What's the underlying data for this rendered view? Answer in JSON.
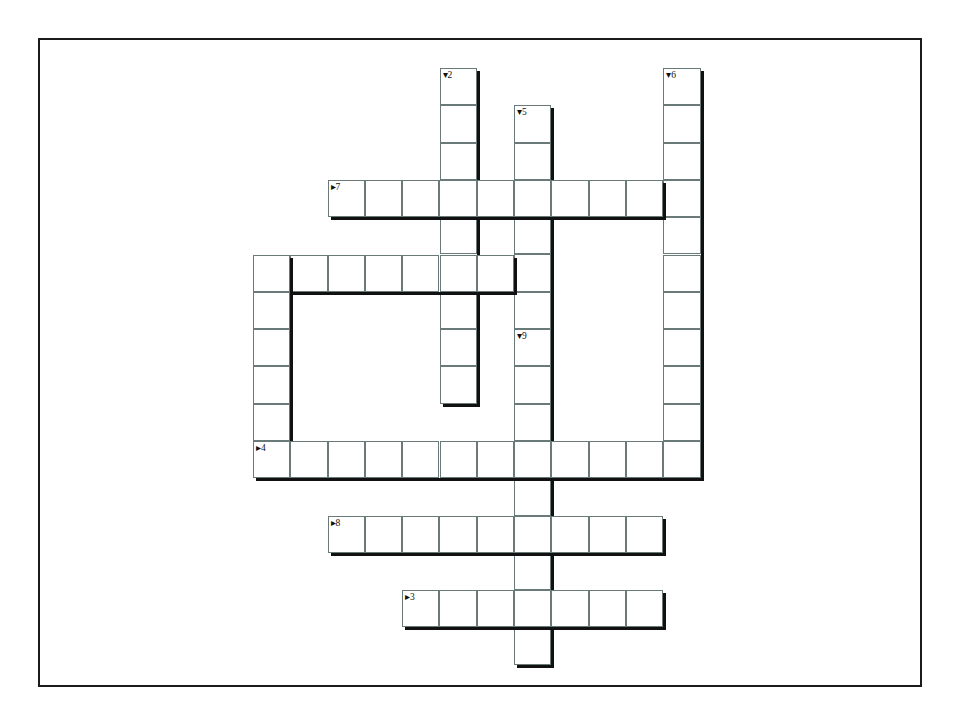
{
  "page": {
    "background_color": "#ffffff",
    "frame_color": "#1b1b1b"
  },
  "puzzle": {
    "title": "Crossword Grid",
    "cell_size": 37.3,
    "origin_x": 251,
    "origin_y": 66,
    "cell_border_color": "#6a7a78",
    "shadow_color": "#111111",
    "across_marker": "▸",
    "down_marker": "▾",
    "entries": [
      {
        "number": "2",
        "direction": "down",
        "label": "▾2",
        "col": 5,
        "row": 0,
        "length": 9,
        "letters": [
          "",
          "",
          "",
          "",
          "",
          "",
          "",
          "",
          ""
        ]
      },
      {
        "number": "6",
        "direction": "down",
        "label": "▾6",
        "col": 11,
        "row": 0,
        "length": 11,
        "letters": [
          "",
          "",
          "",
          "",
          "",
          "",
          "",
          "",
          "",
          "",
          ""
        ]
      },
      {
        "number": "5",
        "direction": "down",
        "label": "▾5",
        "col": 7,
        "row": 1,
        "length": 6,
        "letters": [
          "",
          "",
          "",
          "",
          "",
          ""
        ]
      },
      {
        "number": "7",
        "direction": "across",
        "label": "▸7",
        "col": 2,
        "row": 3,
        "length": 9,
        "letters": [
          "",
          "",
          "",
          "",
          "",
          "",
          "",
          "",
          ""
        ]
      },
      {
        "number": "1",
        "direction": "across",
        "label": "▸1/▾10",
        "col": 0,
        "row": 5,
        "length": 7,
        "letters": [
          "",
          "",
          "",
          "",
          "",
          "",
          ""
        ]
      },
      {
        "number": "10",
        "direction": "down",
        "label": "",
        "col": 0,
        "row": 5,
        "length": 5,
        "letters": [
          "",
          "",
          "",
          "",
          ""
        ]
      },
      {
        "number": "9",
        "direction": "down",
        "label": "▾9",
        "col": 7,
        "row": 7,
        "length": 9,
        "letters": [
          "",
          "",
          "",
          "",
          "",
          "",
          "",
          "",
          ""
        ]
      },
      {
        "number": "4",
        "direction": "across",
        "label": "▸4",
        "col": 0,
        "row": 10,
        "length": 12,
        "letters": [
          "",
          "",
          "",
          "",
          "",
          "",
          "",
          "",
          "",
          "",
          "",
          ""
        ]
      },
      {
        "number": "8",
        "direction": "across",
        "label": "▸8",
        "col": 2,
        "row": 12,
        "length": 9,
        "letters": [
          "",
          "",
          "",
          "",
          "",
          "",
          "",
          "",
          ""
        ]
      },
      {
        "number": "3",
        "direction": "across",
        "label": "▸3",
        "col": 4,
        "row": 14,
        "length": 7,
        "letters": [
          "",
          "",
          "",
          "",
          "",
          "",
          ""
        ]
      }
    ]
  }
}
